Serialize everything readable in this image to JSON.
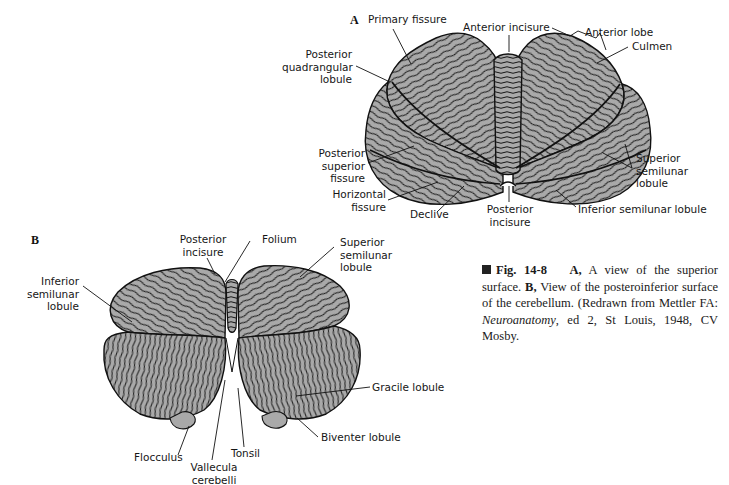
{
  "figure": {
    "number": "Fig. 14-8",
    "colors": {
      "tissue_fill": "#a9a9a9",
      "outline": "#111111",
      "background": "#ffffff"
    },
    "panel_a": {
      "letter": "A",
      "view": "superior surface",
      "labels": {
        "primary_fissure": "Primary fissure",
        "anterior_incisure": "Anterior incisure",
        "anterior_lobe": "Anterior lobe",
        "culmen": "Culmen",
        "posterior_quadrangular_lobule": [
          "Posterior",
          "quadrangular",
          "lobule"
        ],
        "posterior_superior_fissure": [
          "Posterior",
          "superior",
          "fissure"
        ],
        "superior_semilunar_lobule": [
          "Superior",
          "semilunar",
          "lobule"
        ],
        "horizontal_fissure": [
          "Horizontal",
          "fissure"
        ],
        "declive": "Declive",
        "posterior_incisure": [
          "Posterior",
          "incisure"
        ],
        "inferior_semilunar_lobule": "Inferior semilunar lobule"
      }
    },
    "panel_b": {
      "letter": "B",
      "view": "posteroinferior surface",
      "labels": {
        "posterior_incisure": [
          "Posterior",
          "incisure"
        ],
        "folium": "Folium",
        "superior_semilunar_lobule": [
          "Superior",
          "semilunar",
          "lobule"
        ],
        "inferior_semilunar_lobule": [
          "Inferior",
          "semilunar",
          "lobule"
        ],
        "gracile_lobule": "Gracile lobule",
        "biventer_lobule": "Biventer lobule",
        "flocculus": "Flocculus",
        "vallecula_cerebelli": [
          "Vallecula",
          "cerebelli"
        ],
        "tonsil": "Tonsil"
      }
    },
    "caption": {
      "label": "Fig. 14-8",
      "a_marker": "A,",
      "a_text": "A view of the superior surface.",
      "b_marker": "B,",
      "b_text": "View of the posteroinferior surface of the cerebellum. (Redrawn from Mettler FA:",
      "book_title": "Neuroanatomy",
      "tail": ", ed 2, St Louis, 1948, CV Mosby."
    }
  }
}
